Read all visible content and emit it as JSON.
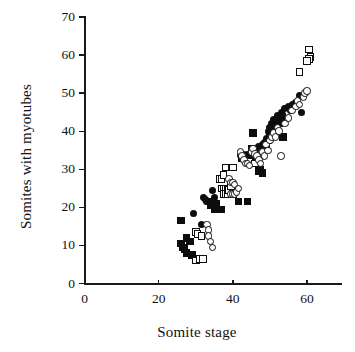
{
  "chart_data": {
    "type": "scatter",
    "title": "",
    "xlabel": "Somite stage",
    "ylabel": "Somites with myotubes",
    "xlim": [
      0,
      70
    ],
    "ylim": [
      0,
      70
    ],
    "xticks": [
      0,
      20,
      40,
      60
    ],
    "yticks": [
      0,
      10,
      20,
      30,
      40,
      50,
      60,
      70
    ],
    "grid": false,
    "legend": "none",
    "series": [
      {
        "name": "filled-square",
        "marker": "filled square",
        "color": "#0d0d0d",
        "points": [
          [
            26,
            16.5
          ],
          [
            26,
            10.5
          ],
          [
            26.5,
            9.5
          ],
          [
            27,
            9.0
          ],
          [
            27.5,
            12.0
          ],
          [
            27.5,
            8.0
          ],
          [
            28.5,
            11.0
          ],
          [
            29,
            7.5
          ],
          [
            33.5,
            21.5
          ],
          [
            34,
            20.5
          ],
          [
            35,
            19.5
          ],
          [
            35.5,
            21.0
          ],
          [
            36,
            19.5
          ],
          [
            37,
            19.5
          ],
          [
            41.5,
            21.5
          ],
          [
            44,
            21.5
          ],
          [
            42.5,
            33.0
          ],
          [
            43,
            33.5
          ],
          [
            44,
            33.0
          ],
          [
            45,
            35.5
          ],
          [
            45.5,
            39.5
          ],
          [
            46,
            33.0
          ],
          [
            46.5,
            31.5
          ],
          [
            47,
            29.5
          ],
          [
            47.5,
            30.0
          ],
          [
            48,
            29.0
          ],
          [
            48.5,
            36.0
          ],
          [
            49,
            35.5
          ],
          [
            49.5,
            37.5
          ],
          [
            50,
            38.5
          ],
          [
            50.5,
            40.0
          ],
          [
            51,
            39.5
          ],
          [
            51.5,
            40.5
          ],
          [
            52,
            41.5
          ],
          [
            52.5,
            42.0
          ],
          [
            53,
            43.0
          ],
          [
            53.5,
            38.5
          ]
        ]
      },
      {
        "name": "filled-circle",
        "marker": "filled circle",
        "color": "#0d0d0d",
        "points": [
          [
            29.5,
            18.5
          ],
          [
            31.5,
            15.5
          ],
          [
            32,
            22.5
          ],
          [
            32.5,
            22.0
          ],
          [
            33,
            21.5
          ],
          [
            34.5,
            24.5
          ],
          [
            35,
            22.5
          ],
          [
            42,
            33.5
          ],
          [
            43,
            34.0
          ],
          [
            43.5,
            33.5
          ],
          [
            44,
            34.0
          ],
          [
            46,
            35.0
          ],
          [
            47,
            36.0
          ],
          [
            48,
            36.5
          ],
          [
            48.5,
            37.0
          ],
          [
            49,
            38.0
          ],
          [
            49.5,
            40.0
          ],
          [
            50,
            41.0
          ],
          [
            50.5,
            42.0
          ],
          [
            51,
            43.0
          ],
          [
            51.5,
            41.5
          ],
          [
            52,
            44.0
          ],
          [
            52.5,
            43.5
          ],
          [
            53,
            45.0
          ],
          [
            53.5,
            44.5
          ],
          [
            54,
            46.0
          ],
          [
            55,
            46.5
          ],
          [
            55.5,
            45.5
          ],
          [
            56,
            47.0
          ],
          [
            57,
            47.5
          ],
          [
            58,
            49.5
          ],
          [
            58.5,
            45.0
          ]
        ]
      },
      {
        "name": "open-square",
        "marker": "open square",
        "color": "#0d0d0d",
        "points": [
          [
            30,
            13.5
          ],
          [
            30.5,
            13.0
          ],
          [
            30,
            6.0
          ],
          [
            31,
            6.5
          ],
          [
            31.5,
            12.5
          ],
          [
            32,
            6.5
          ],
          [
            36.5,
            27.5
          ],
          [
            37,
            27.5
          ],
          [
            37.5,
            28.5
          ],
          [
            38,
            30.5
          ],
          [
            37,
            25.0
          ],
          [
            37.5,
            25.0
          ],
          [
            38,
            25.0
          ],
          [
            38.5,
            24.5
          ],
          [
            37.5,
            23.5
          ],
          [
            38,
            23.5
          ],
          [
            38.5,
            23.5
          ],
          [
            39,
            24.5
          ],
          [
            39.5,
            25.5
          ],
          [
            40,
            30.5
          ],
          [
            40,
            23.5
          ],
          [
            44.5,
            32.0
          ],
          [
            46,
            31.5
          ],
          [
            58,
            55.5
          ],
          [
            60.5,
            61.5
          ],
          [
            61,
            59.5
          ],
          [
            60.5,
            59.0
          ],
          [
            60,
            58.5
          ]
        ]
      },
      {
        "name": "open-circle",
        "marker": "open circle",
        "color": "#0d0d0d",
        "points": [
          [
            33,
            15.5
          ],
          [
            33.5,
            14.0
          ],
          [
            33.5,
            12.5
          ],
          [
            34,
            11.0
          ],
          [
            34.5,
            9.5
          ],
          [
            39,
            27.5
          ],
          [
            39.5,
            26.5
          ],
          [
            40,
            26.5
          ],
          [
            40.5,
            26.0
          ],
          [
            39.5,
            23.5
          ],
          [
            40,
            23.5
          ],
          [
            40.5,
            23.5
          ],
          [
            41,
            24.0
          ],
          [
            41.5,
            25.0
          ],
          [
            42,
            34.5
          ],
          [
            42.5,
            33.5
          ],
          [
            43,
            32.5
          ],
          [
            43.5,
            31.5
          ],
          [
            44,
            31.5
          ],
          [
            44.5,
            31.0
          ],
          [
            45,
            34.5
          ],
          [
            45.5,
            35.5
          ],
          [
            46,
            34.0
          ],
          [
            46.5,
            33.5
          ],
          [
            47,
            32.5
          ],
          [
            47.5,
            31.5
          ],
          [
            48,
            34.5
          ],
          [
            48.5,
            33.5
          ],
          [
            49,
            36.5
          ],
          [
            49.5,
            35.0
          ],
          [
            50,
            37.5
          ],
          [
            50.5,
            38.5
          ],
          [
            51,
            39.5
          ],
          [
            51.5,
            38.5
          ],
          [
            52,
            41.0
          ],
          [
            52.5,
            40.0
          ],
          [
            53,
            33.5
          ],
          [
            54,
            42.0
          ],
          [
            55,
            43.5
          ],
          [
            56,
            45.5
          ],
          [
            57,
            46.5
          ],
          [
            57.5,
            48.0
          ],
          [
            58,
            47.0
          ],
          [
            59,
            49.0
          ],
          [
            59.5,
            50.0
          ],
          [
            60,
            50.5
          ]
        ]
      }
    ]
  }
}
